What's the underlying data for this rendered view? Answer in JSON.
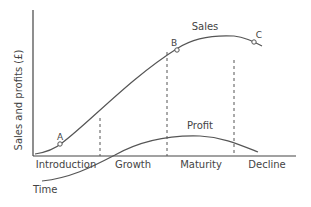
{
  "diagram": {
    "axes": {
      "y_label": "Sales and profits (£)",
      "x_label": "Time"
    },
    "stages": [
      "Introduction",
      "Growth",
      "Maturity",
      "Decline"
    ],
    "curves": {
      "sales_label": "Sales",
      "profit_label": "Profit"
    },
    "points": [
      "A",
      "B",
      "C"
    ],
    "colors": {
      "line": "#555555",
      "text": "#444444",
      "background": "#ffffff"
    }
  }
}
